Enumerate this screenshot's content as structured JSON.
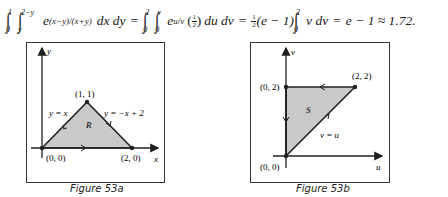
{
  "equation": {
    "lhs": {
      "outer_lower": "0",
      "outer_upper": "1",
      "inner_lower": "y",
      "inner_upper": "2−y",
      "integrand_base": "e",
      "integrand_exp": "(x−y)/(x+y)",
      "differentials": "dx dy"
    },
    "mid1": {
      "outer_lower": "0",
      "outer_upper": "2",
      "inner_lower": "0",
      "inner_upper": "v",
      "integrand_base": "e",
      "integrand_exp": "u/v",
      "factor_num": "1",
      "factor_den": "2",
      "differentials": "du dv"
    },
    "mid2": {
      "coef_num": "1",
      "coef_den": "2",
      "coef_rest": "(e − 1)",
      "lower": "0",
      "upper": "2",
      "integrand": "v dv"
    },
    "rhs": "e − 1 ≈ 1.72.",
    "equals": "="
  },
  "figures": [
    {
      "caption": "Figure 53a",
      "axis_labels": {
        "horizontal": "x",
        "vertical": "y"
      },
      "region_label": "R",
      "vertices": [
        {
          "label": "(0, 0)",
          "x": 0,
          "y": 0
        },
        {
          "label": "(1, 1)",
          "x": 1,
          "y": 1
        },
        {
          "label": "(2, 0)",
          "x": 2,
          "y": 0
        }
      ],
      "edge_labels": [
        "y = x",
        "y = −x + 2"
      ],
      "fill_color": "#c9c9c9",
      "line_color": "#1f1f1f"
    },
    {
      "caption": "Figure 53b",
      "axis_labels": {
        "horizontal": "u",
        "vertical": "v"
      },
      "region_label": "S",
      "vertices": [
        {
          "label": "(0, 0)",
          "u": 0,
          "v": 0
        },
        {
          "label": "(0, 2)",
          "u": 0,
          "v": 2
        },
        {
          "label": "(2, 2)",
          "u": 2,
          "v": 2
        }
      ],
      "edge_labels": [
        "v = u"
      ],
      "fill_color": "#c9c9c9",
      "line_color": "#1f1f1f"
    }
  ]
}
